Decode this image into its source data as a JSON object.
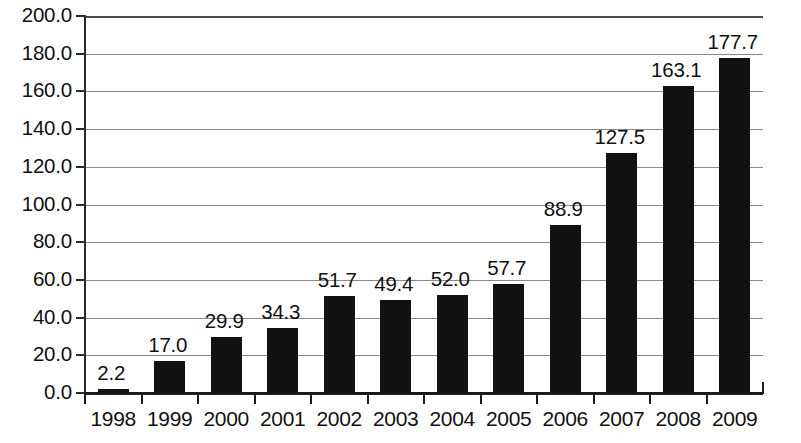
{
  "chart_data": {
    "type": "bar",
    "title": "",
    "subtitle": "",
    "xlabel": "",
    "ylabel": "",
    "categories": [
      "1998",
      "1999",
      "2000",
      "2001",
      "2002",
      "2003",
      "2004",
      "2005",
      "2006",
      "2007",
      "2008",
      "2009"
    ],
    "values": [
      2.2,
      17.0,
      29.9,
      34.3,
      51.7,
      49.4,
      52.0,
      57.7,
      88.9,
      127.5,
      163.1,
      177.7
    ],
    "value_labels": [
      "2.2",
      "17.0",
      "29.9",
      "34.3",
      "51.7",
      "49.4",
      "52.0",
      "57.7",
      "88.9",
      "127.5",
      "163.1",
      "177.7"
    ],
    "ylim": [
      0,
      200
    ],
    "ytick_step": 20,
    "ytick_values": [
      200,
      180,
      160,
      140,
      120,
      100,
      80,
      60,
      40,
      20,
      0
    ],
    "ytick_labels": [
      "200.0",
      "180.0",
      "160.0",
      "140.0",
      "120.0",
      "100.0",
      "80.0",
      "60.0",
      "40.0",
      "20.0",
      "0.0"
    ],
    "grid": true,
    "grid_axis": "y",
    "legend": false,
    "legend_position": "none",
    "bar_color": "#111111",
    "grid_color": "#8a8a8a",
    "axis_color": "#1a1a1a",
    "background_color": "#ffffff",
    "data_labels_shown": true
  }
}
